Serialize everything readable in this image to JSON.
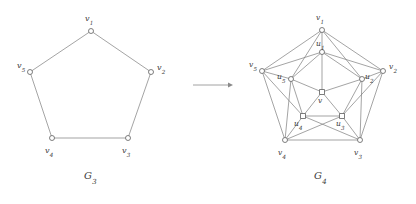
{
  "figure": {
    "background_color": "#ffffff",
    "edge_color": "#7d7d7d",
    "node_fill": "#ffffff",
    "node_stroke": "#5f5f5f",
    "label_color": "#3b3b3b"
  },
  "arrow": {
    "name": "right-arrow",
    "from_x": 193,
    "to_x": 233,
    "y": 85
  },
  "left_graph": {
    "caption_base": "G",
    "caption_sub": "3",
    "caption_x": 84,
    "caption_y": 170,
    "nodes": [
      {
        "id": "v1",
        "base": "v",
        "sub": "1",
        "x": 91,
        "y": 31,
        "lx": 85,
        "ly": 15,
        "shape": "circle"
      },
      {
        "id": "v2",
        "base": "v",
        "sub": "2",
        "x": 151,
        "y": 72,
        "lx": 157,
        "ly": 64,
        "shape": "circle"
      },
      {
        "id": "v3",
        "base": "v",
        "sub": "3",
        "x": 128,
        "y": 138,
        "lx": 122,
        "ly": 147,
        "shape": "circle"
      },
      {
        "id": "v4",
        "base": "v",
        "sub": "4",
        "x": 52,
        "y": 138,
        "lx": 45,
        "ly": 147,
        "shape": "circle"
      },
      {
        "id": "v5",
        "base": "v",
        "sub": "5",
        "x": 30,
        "y": 72,
        "lx": 17,
        "ly": 62,
        "shape": "circle"
      }
    ],
    "edges": [
      [
        "v1",
        "v2"
      ],
      [
        "v2",
        "v3"
      ],
      [
        "v3",
        "v4"
      ],
      [
        "v4",
        "v5"
      ],
      [
        "v5",
        "v1"
      ]
    ]
  },
  "right_graph": {
    "caption_base": "G",
    "caption_sub": "4",
    "caption_x": 314,
    "caption_y": 170,
    "nodes": [
      {
        "id": "v1",
        "base": "v",
        "sub": "1",
        "x": 322,
        "y": 30,
        "lx": 316,
        "ly": 14,
        "shape": "circle"
      },
      {
        "id": "v2",
        "base": "v",
        "sub": "2",
        "x": 383,
        "y": 71,
        "lx": 389,
        "ly": 63,
        "shape": "circle"
      },
      {
        "id": "v3",
        "base": "v",
        "sub": "3",
        "x": 360,
        "y": 140,
        "lx": 354,
        "ly": 149,
        "shape": "circle"
      },
      {
        "id": "v4",
        "base": "v",
        "sub": "4",
        "x": 285,
        "y": 140,
        "lx": 278,
        "ly": 149,
        "shape": "circle"
      },
      {
        "id": "v5",
        "base": "v",
        "sub": "5",
        "x": 262,
        "y": 71,
        "lx": 249,
        "ly": 61,
        "shape": "circle"
      },
      {
        "id": "u1",
        "base": "u",
        "sub": "1",
        "x": 322,
        "y": 52,
        "lx": 316,
        "ly": 40,
        "shape": "circle"
      },
      {
        "id": "u2",
        "base": "u",
        "sub": "2",
        "x": 362,
        "y": 79,
        "lx": 365,
        "ly": 73,
        "shape": "circle"
      },
      {
        "id": "u3",
        "base": "u",
        "sub": "3",
        "x": 342,
        "y": 116,
        "lx": 336,
        "ly": 120,
        "shape": "square"
      },
      {
        "id": "u4",
        "base": "u",
        "sub": "4",
        "x": 303,
        "y": 116,
        "lx": 294,
        "ly": 120,
        "shape": "square"
      },
      {
        "id": "u5",
        "base": "u",
        "sub": "5",
        "x": 291,
        "y": 79,
        "lx": 277,
        "ly": 73,
        "shape": "circle"
      },
      {
        "id": "v",
        "base": "v",
        "sub": "",
        "x": 322,
        "y": 92,
        "lx": 318,
        "ly": 97,
        "shape": "square"
      }
    ],
    "edges": [
      [
        "v1",
        "v2"
      ],
      [
        "v2",
        "v3"
      ],
      [
        "v3",
        "v4"
      ],
      [
        "v4",
        "v5"
      ],
      [
        "v5",
        "v1"
      ],
      [
        "v1",
        "u1"
      ],
      [
        "v2",
        "u2"
      ],
      [
        "v3",
        "u3"
      ],
      [
        "v4",
        "u4"
      ],
      [
        "v5",
        "u5"
      ],
      [
        "u1",
        "u2"
      ],
      [
        "u2",
        "u3"
      ],
      [
        "u3",
        "u4"
      ],
      [
        "u4",
        "u5"
      ],
      [
        "u5",
        "u1"
      ],
      [
        "v",
        "u1"
      ],
      [
        "v",
        "u2"
      ],
      [
        "v",
        "u3"
      ],
      [
        "v",
        "u4"
      ],
      [
        "v",
        "u5"
      ],
      [
        "v1",
        "u2"
      ],
      [
        "v1",
        "u5"
      ],
      [
        "v2",
        "u1"
      ],
      [
        "v2",
        "u3"
      ],
      [
        "v3",
        "u2"
      ],
      [
        "v3",
        "u4"
      ],
      [
        "v4",
        "u3"
      ],
      [
        "v4",
        "u5"
      ],
      [
        "v5",
        "u1"
      ],
      [
        "v5",
        "u4"
      ]
    ]
  }
}
